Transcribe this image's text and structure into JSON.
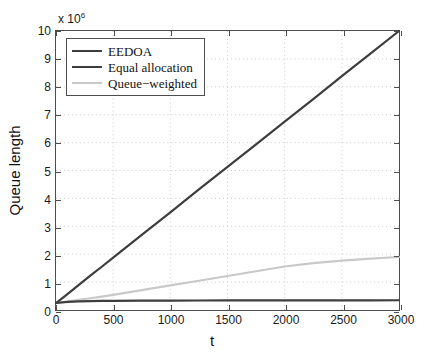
{
  "chart_data": {
    "type": "line",
    "title": "",
    "xlabel": "t",
    "ylabel": "Queue length",
    "y_multiplier_text": "x 10",
    "y_multiplier_exponent": "6",
    "y_multiplier_value": 1000000,
    "xlim": [
      0,
      3000
    ],
    "ylim": [
      0,
      10
    ],
    "xticks": [
      0,
      500,
      1000,
      1500,
      2000,
      2500,
      3000
    ],
    "xtick_labels": [
      "0",
      "500",
      "1000",
      "1500",
      "2000",
      "2500",
      "3000"
    ],
    "yticks": [
      0,
      1,
      2,
      3,
      4,
      5,
      6,
      7,
      8,
      9,
      10
    ],
    "ytick_labels": [
      "0",
      "1",
      "2",
      "3",
      "4",
      "5",
      "6",
      "7",
      "8",
      "9",
      "10"
    ],
    "grid": true,
    "grid_style": "dotted",
    "grid_color": "#bfbfbf",
    "legend_position": "top-left",
    "x": [
      0,
      100,
      200,
      300,
      400,
      500,
      750,
      1000,
      1250,
      1500,
      1750,
      2000,
      2250,
      2500,
      2750,
      3000
    ],
    "series": [
      {
        "name": "EEDOA",
        "color": "#3d3d3d",
        "width": 2.2,
        "values": [
          0.25,
          0.29,
          0.31,
          0.32,
          0.325,
          0.33,
          0.335,
          0.338,
          0.34,
          0.342,
          0.344,
          0.345,
          0.346,
          0.347,
          0.348,
          0.35
        ]
      },
      {
        "name": "Equal allocation",
        "color": "#3d3d3d",
        "width": 2.2,
        "values": [
          0.25,
          0.57,
          0.9,
          1.23,
          1.55,
          1.88,
          2.69,
          3.5,
          4.32,
          5.13,
          5.94,
          6.75,
          7.56,
          8.38,
          9.19,
          10.0
        ]
      },
      {
        "name": "Queue−weighted",
        "color": "#c9c9c9",
        "width": 2.2,
        "values": [
          0.25,
          0.3,
          0.36,
          0.42,
          0.48,
          0.54,
          0.71,
          0.88,
          1.05,
          1.22,
          1.39,
          1.56,
          1.68,
          1.77,
          1.84,
          1.9
        ]
      }
    ]
  }
}
